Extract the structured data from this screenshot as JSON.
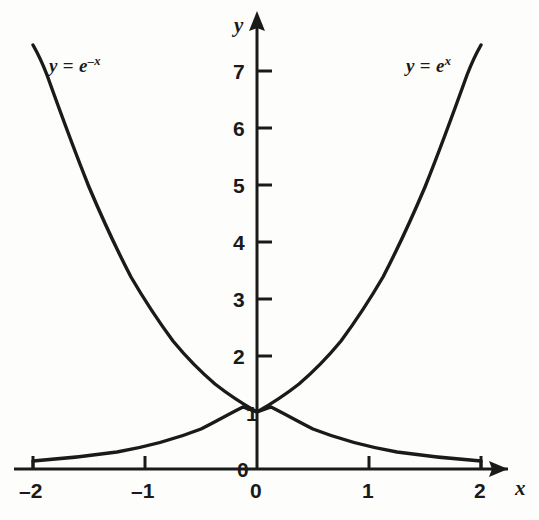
{
  "figure": {
    "title": "",
    "background_color": "#fdfdfb",
    "ink_color": "#1a1a1a"
  },
  "axes": {
    "x_axis_name": "x",
    "y_axis_name": "y",
    "x_tick_labels": [
      "–2",
      "–1",
      "0",
      "1",
      "2"
    ],
    "y_tick_labels": [
      "0",
      "1",
      "2",
      "3",
      "4",
      "5",
      "6",
      "7"
    ],
    "origin_zero_x_label": "0",
    "origin_zero_y_label": "0"
  },
  "curves": [
    {
      "id": "exp-neg-x",
      "label_html": "y<span class=\"op\"> = </span>e<sup>–x</sup>",
      "label_text": "y = e–x"
    },
    {
      "id": "exp-x",
      "label_html": "y<span class=\"op\"> = </span>e<sup>x</sup>",
      "label_text": "y = ex"
    }
  ],
  "chart_data": {
    "type": "line",
    "title": "",
    "xlabel": "x",
    "ylabel": "y",
    "xlim": [
      -2.15,
      2.6
    ],
    "ylim": [
      0,
      7.9
    ],
    "xticks": [
      -2,
      -1,
      0,
      1,
      2
    ],
    "yticks": [
      0,
      1,
      2,
      3,
      4,
      5,
      6,
      7
    ],
    "xticklabels": [
      "–2",
      "–1",
      "0",
      "1",
      "2"
    ],
    "yticklabels": [
      "0",
      "1",
      "2",
      "3",
      "4",
      "5",
      "6",
      "7"
    ],
    "grid": false,
    "legend": "inline-curve-labels",
    "annotations": [
      {
        "text": "y = e^-x",
        "x": -1.6,
        "y": 7.0
      },
      {
        "text": "y = e^x",
        "x": 1.45,
        "y": 7.0
      }
    ],
    "series": [
      {
        "name": "y = e^x",
        "x": [
          -2,
          -1.75,
          -1.5,
          -1.25,
          -1,
          -0.75,
          -0.5,
          -0.25,
          0,
          0.25,
          0.5,
          0.75,
          1,
          1.25,
          1.5,
          1.75,
          2
        ],
        "values": [
          0.135,
          0.174,
          0.223,
          0.287,
          0.368,
          0.472,
          0.607,
          0.779,
          1.0,
          1.284,
          1.649,
          2.117,
          2.718,
          3.49,
          4.482,
          5.755,
          7.389
        ]
      },
      {
        "name": "y = e^-x",
        "x": [
          -2,
          -1.75,
          -1.5,
          -1.25,
          -1,
          -0.75,
          -0.5,
          -0.25,
          0,
          0.25,
          0.5,
          0.75,
          1,
          1.25,
          1.5,
          1.75,
          2
        ],
        "values": [
          7.389,
          5.755,
          4.482,
          3.49,
          2.718,
          2.117,
          1.649,
          1.284,
          1.0,
          0.779,
          0.607,
          0.472,
          0.368,
          0.287,
          0.223,
          0.174,
          0.135
        ]
      }
    ]
  }
}
